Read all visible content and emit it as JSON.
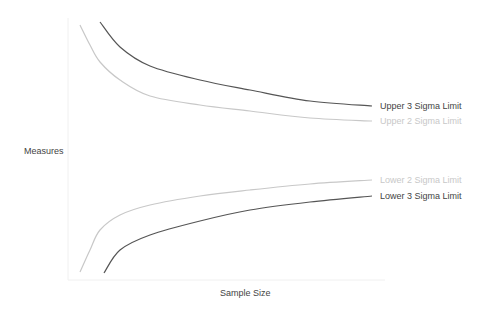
{
  "chart_data": {
    "type": "line",
    "title": "",
    "xlabel": "Sample Size",
    "ylabel": "Measures",
    "grid": false,
    "legend": "inline labels at right end of each line",
    "series": [
      {
        "name": "Upper 3 Sigma Limit",
        "color": "#555555",
        "points": [
          [
            100,
            22
          ],
          [
            120,
            47
          ],
          [
            150,
            66
          ],
          [
            200,
            80
          ],
          [
            250,
            90
          ],
          [
            310,
            101
          ],
          [
            372,
            106
          ]
        ]
      },
      {
        "name": "Upper 2 Sigma Limit",
        "color": "#c8c8c8",
        "points": [
          [
            80,
            25
          ],
          [
            90,
            45
          ],
          [
            100,
            62
          ],
          [
            120,
            80
          ],
          [
            150,
            96
          ],
          [
            200,
            105
          ],
          [
            250,
            111
          ],
          [
            310,
            118
          ],
          [
            372,
            121
          ]
        ]
      },
      {
        "name": "Lower 2 Sigma Limit",
        "color": "#c8c8c8",
        "points": [
          [
            80,
            272
          ],
          [
            90,
            250
          ],
          [
            100,
            230
          ],
          [
            120,
            215
          ],
          [
            150,
            205
          ],
          [
            200,
            196
          ],
          [
            250,
            190
          ],
          [
            310,
            184
          ],
          [
            372,
            180
          ]
        ]
      },
      {
        "name": "Lower 3 Sigma Limit",
        "color": "#555555",
        "points": [
          [
            104,
            273
          ],
          [
            120,
            250
          ],
          [
            150,
            235
          ],
          [
            200,
            221
          ],
          [
            250,
            210
          ],
          [
            310,
            202
          ],
          [
            372,
            196
          ]
        ]
      }
    ]
  },
  "labels": {
    "upper3": "Upper 3 Sigma Limit",
    "upper2": "Upper 2 Sigma Limit",
    "lower2": "Lower 2 Sigma Limit",
    "lower3": "Lower 3 Sigma Limit",
    "xlabel": "Sample Size",
    "ylabel": "Measures"
  }
}
